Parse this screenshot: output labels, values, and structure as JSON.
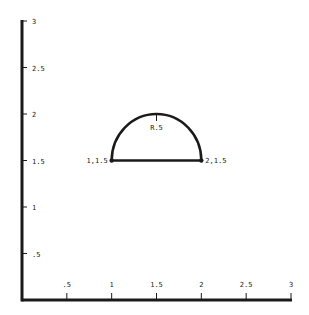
{
  "diagram": {
    "type": "coordinate-geometry",
    "axes": {
      "x": {
        "min": 0,
        "max": 3,
        "ticks": [
          {
            "value": 0.5,
            "label": ".5"
          },
          {
            "value": 1,
            "label": "1"
          },
          {
            "value": 1.5,
            "label": "1.5"
          },
          {
            "value": 2,
            "label": "2"
          },
          {
            "value": 2.5,
            "label": "2.5"
          },
          {
            "value": 3,
            "label": "3"
          }
        ]
      },
      "y": {
        "min": 0,
        "max": 3,
        "ticks": [
          {
            "value": 0.5,
            "label": ".5"
          },
          {
            "value": 1,
            "label": "1"
          },
          {
            "value": 1.5,
            "label": "1.5"
          },
          {
            "value": 2,
            "label": "2"
          },
          {
            "value": 2.5,
            "label": "2.5"
          },
          {
            "value": 3,
            "label": "3"
          }
        ]
      }
    },
    "shape": {
      "kind": "semicircle",
      "center": [
        1.5,
        1.5
      ],
      "radius": 0.5,
      "radius_label": "R.5",
      "endpoints": [
        {
          "x": 1,
          "y": 1.5,
          "label": "1,1.5"
        },
        {
          "x": 2,
          "y": 1.5,
          "label": "2,1.5"
        }
      ]
    },
    "colors": {
      "stroke": "#1a1a1a",
      "background": "#ffffff"
    }
  }
}
